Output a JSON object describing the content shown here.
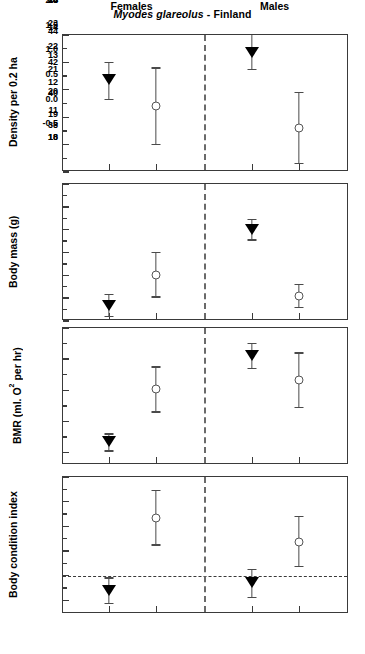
{
  "chart_data": {
    "type": "scatter",
    "title_species": "Myodes glareolus",
    "title_rest": " - Finland",
    "title": "Myodes glareolus - Finland",
    "layout": "4 stacked panels, shared x-axis, vertical dashed divider between sex groups",
    "grid": false,
    "legend": "none",
    "x_groups": [
      "Females",
      "Males"
    ],
    "x_positions": [
      {
        "group": "Females",
        "marker": "filled-down-triangle",
        "x_px_frac": 0.161
      },
      {
        "group": "Females",
        "marker": "open-circle",
        "x_px_frac": 0.325
      },
      {
        "group": "Males",
        "marker": "filled-down-triangle",
        "x_px_frac": 0.661
      },
      {
        "group": "Males",
        "marker": "open-circle",
        "x_px_frac": 0.825
      }
    ],
    "panels": [
      {
        "id": "density",
        "ylabel": "Density per 0.2 ha",
        "ylim": [
          10,
          15
        ],
        "yticks": [
          10,
          11,
          12,
          13,
          14,
          15
        ],
        "yticklabels": [
          "10",
          "11",
          "12",
          "13",
          "14",
          "15"
        ],
        "yminor": [
          10.5,
          11.5,
          12.5,
          13.5,
          14.5
        ],
        "points": [
          {
            "group": "Females",
            "marker": "filled-down-triangle",
            "value": 13.35,
            "low": 12.65,
            "high": 14.0
          },
          {
            "group": "Females",
            "marker": "open-circle",
            "value": 12.4,
            "low": 11.0,
            "high": 13.8
          },
          {
            "group": "Males",
            "marker": "filled-down-triangle",
            "value": 14.35,
            "low": 13.75,
            "high": 15.0
          },
          {
            "group": "Males",
            "marker": "open-circle",
            "value": 11.6,
            "low": 10.3,
            "high": 12.9
          }
        ]
      },
      {
        "id": "body-mass",
        "ylabel": "Body mass (g)",
        "ylim": [
          18,
          24
        ],
        "yticks": [
          18,
          19,
          20,
          21,
          22,
          23,
          24
        ],
        "yticklabels": [
          "18",
          "19",
          "20",
          "21",
          "22",
          "23",
          "24"
        ],
        "yminor": [
          18.5,
          19.5,
          20.5,
          21.5,
          22.5,
          23.5
        ],
        "points": [
          {
            "group": "Females",
            "marker": "filled-down-triangle",
            "value": 18.65,
            "low": 18.2,
            "high": 19.15
          },
          {
            "group": "Females",
            "marker": "open-circle",
            "value": 20.0,
            "low": 19.05,
            "high": 21.0
          },
          {
            "group": "Males",
            "marker": "filled-down-triangle",
            "value": 22.0,
            "low": 21.55,
            "high": 22.45
          },
          {
            "group": "Males",
            "marker": "open-circle",
            "value": 19.1,
            "low": 18.6,
            "high": 19.6
          }
        ]
      },
      {
        "id": "bmr",
        "ylabel_pre": "BMR (ml. O",
        "ylabel_sup": "2",
        "ylabel_post": " per hr)",
        "ylabel": "BMR (ml. O2 per hr)",
        "ylim": [
          37.2,
          46
        ],
        "yticks": [
          38,
          40,
          42,
          44,
          46
        ],
        "yticklabels": [
          "38",
          "40",
          "42",
          "44",
          "46"
        ],
        "yminor": [
          39,
          41,
          43,
          45
        ],
        "points": [
          {
            "group": "Females",
            "marker": "filled-down-triangle",
            "value": 38.65,
            "low": 38.1,
            "high": 39.2
          },
          {
            "group": "Females",
            "marker": "open-circle",
            "value": 42.1,
            "low": 40.6,
            "high": 43.5
          },
          {
            "group": "Males",
            "marker": "filled-down-triangle",
            "value": 44.2,
            "low": 43.4,
            "high": 45.0
          },
          {
            "group": "Males",
            "marker": "open-circle",
            "value": 42.65,
            "low": 40.9,
            "high": 44.4
          }
        ]
      },
      {
        "id": "body-condition",
        "ylabel": "Body condition index",
        "ylim": [
          -0.78,
          2.0
        ],
        "yticks": [
          -0.5,
          0.0,
          0.5,
          1.0,
          1.5,
          2.0
        ],
        "yticklabels": [
          "-0.5",
          "0.0",
          "0.5",
          "1.0",
          "1.5",
          "2.0"
        ],
        "yminor": [
          -0.25,
          0.25,
          0.75,
          1.25,
          1.75
        ],
        "zero_reference_line": 0.0,
        "points": [
          {
            "group": "Females",
            "marker": "filled-down-triangle",
            "value": -0.32,
            "low": -0.57,
            "high": -0.05
          },
          {
            "group": "Females",
            "marker": "open-circle",
            "value": 1.17,
            "low": 0.62,
            "high": 1.73
          },
          {
            "group": "Males",
            "marker": "filled-down-triangle",
            "value": -0.15,
            "low": -0.44,
            "high": 0.12
          },
          {
            "group": "Males",
            "marker": "open-circle",
            "value": 0.69,
            "low": 0.19,
            "high": 1.2
          }
        ]
      }
    ],
    "colors": {
      "axis": "#3a3a3a",
      "filled_marker": "#000000",
      "open_marker_edge": "#555555",
      "error_bar": "#4a4a4a",
      "divider": "#6a6a6a",
      "background": "#ffffff"
    }
  }
}
